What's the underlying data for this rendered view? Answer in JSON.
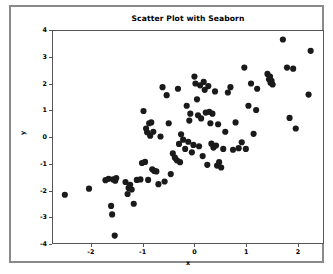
{
  "figure": {
    "title": "Scatter Plot with Seaborn",
    "background_color": "#ffffff",
    "frame_color": "#8a8a8a",
    "marker_color": "#1a1a1a"
  },
  "chart_data": {
    "type": "scatter",
    "title": "Scatter Plot with Seaborn",
    "xlabel": "x",
    "ylabel": "y",
    "xlim": [
      -2.75,
      2.5
    ],
    "ylim": [
      -4,
      4
    ],
    "xticks": [
      -2,
      -1,
      0,
      1,
      2
    ],
    "xtick_labels": [
      "-2",
      "-1",
      "0",
      "1",
      "2"
    ],
    "yticks": [
      -4,
      -3,
      -2,
      -1,
      0,
      1,
      2,
      3,
      4
    ],
    "ytick_labels": [
      "-4",
      "-3",
      "-2",
      "-1",
      "0",
      "1",
      "2",
      "3",
      "4"
    ],
    "grid": false,
    "legend": null,
    "marker": "circle",
    "marker_size": 3.1,
    "series": [
      {
        "name": "points",
        "color": "#1a1a1a",
        "x": [
          -2.52,
          -2.05,
          -1.73,
          -1.67,
          -1.62,
          -1.6,
          -1.58,
          -1.55,
          -1.54,
          -1.52,
          -1.34,
          -1.3,
          -1.28,
          -1.25,
          -1.22,
          -1.18,
          -1.12,
          -1.05,
          -1.02,
          -0.99,
          -0.96,
          -0.94,
          -0.92,
          -0.9,
          -0.88,
          -0.86,
          -0.84,
          -0.82,
          -0.8,
          -0.78,
          -0.74,
          -0.7,
          -0.66,
          -0.62,
          -0.58,
          -0.54,
          -0.5,
          -0.46,
          -0.42,
          -0.38,
          -0.34,
          -0.32,
          -0.3,
          -0.28,
          -0.26,
          -0.22,
          -0.18,
          -0.15,
          -0.12,
          -0.1,
          -0.08,
          -0.05,
          -0.02,
          0.0,
          0.02,
          0.05,
          0.07,
          0.09,
          0.11,
          0.13,
          0.16,
          0.18,
          0.2,
          0.22,
          0.25,
          0.27,
          0.29,
          0.31,
          0.33,
          0.35,
          0.37,
          0.4,
          0.42,
          0.44,
          0.46,
          0.48,
          0.52,
          0.56,
          0.6,
          0.65,
          0.7,
          0.75,
          0.8,
          0.86,
          0.92,
          0.97,
          1.0,
          1.05,
          1.1,
          1.15,
          1.2,
          1.22,
          1.42,
          1.45,
          1.47,
          1.48,
          1.5,
          1.52,
          1.72,
          1.8,
          1.85,
          1.92,
          1.97,
          2.22,
          2.26
        ],
        "y": [
          -2.18,
          -1.95,
          -1.63,
          -1.58,
          -2.6,
          -2.92,
          -1.6,
          -3.72,
          -1.65,
          -1.55,
          -1.7,
          -2.15,
          -1.92,
          -1.8,
          -1.98,
          -2.52,
          -1.62,
          -1.6,
          -0.98,
          0.98,
          -0.94,
          0.32,
          0.18,
          -1.62,
          0.52,
          0.05,
          0.55,
          -1.22,
          0.2,
          -1.28,
          -1.3,
          -1.78,
          0.02,
          1.88,
          -1.68,
          1.58,
          0.52,
          -1.4,
          -0.62,
          -0.78,
          -0.88,
          1.82,
          -0.26,
          -0.95,
          0.1,
          -0.1,
          -0.45,
          1.18,
          -0.18,
          0.62,
          0.88,
          -0.58,
          -0.3,
          2.28,
          2.02,
          1.42,
          0.82,
          -0.35,
          1.95,
          0.7,
          -0.72,
          2.08,
          1.78,
          0.92,
          -1.05,
          1.92,
          0.95,
          0.52,
          -0.25,
          0.88,
          -0.4,
          1.72,
          -0.32,
          -1.08,
          0.48,
          -0.95,
          -1.15,
          -0.45,
          0.2,
          1.68,
          1.88,
          -0.48,
          0.55,
          -0.42,
          -0.2,
          2.62,
          -0.45,
          1.18,
          2.02,
          0.12,
          1.02,
          1.82,
          2.38,
          2.18,
          2.28,
          2.05,
          2.12,
          1.98,
          3.68,
          2.62,
          0.72,
          2.58,
          0.32,
          1.6,
          3.25
        ]
      }
    ]
  }
}
